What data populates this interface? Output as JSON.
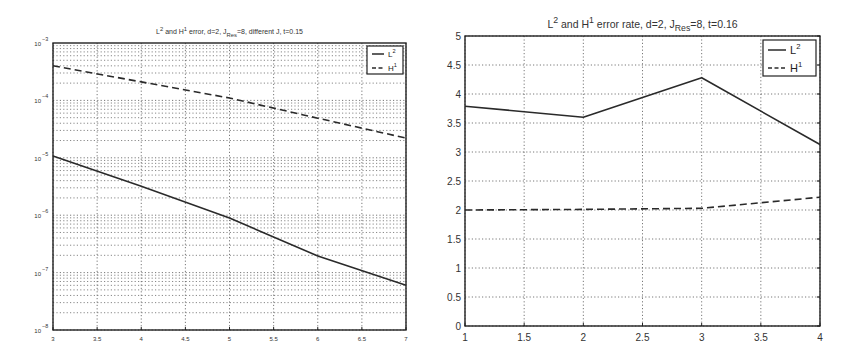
{
  "chart_data": [
    {
      "type": "line",
      "title": "L2 and H1 error, d=2, J_Res=8, different J, t=0.15",
      "title_parts": {
        "pre": "L",
        "sup1": "2",
        "mid": " and H",
        "sup2": "1",
        "post1": " error, d=2, J",
        "sub": "Res",
        "post2": "=8, different J, t=0.15"
      },
      "xlabel": "",
      "ylabel": "",
      "y_scale": "log",
      "xlim": [
        3,
        7
      ],
      "ylim": [
        1e-08,
        0.001
      ],
      "x_ticks": [
        3,
        3.5,
        4,
        4.5,
        5,
        5.5,
        6,
        6.5,
        7
      ],
      "x_tick_labels": [
        "3",
        "3.5",
        "4",
        "4.5",
        "5",
        "5.5",
        "6",
        "6.5",
        "7"
      ],
      "y_ticks_exponents": [
        -3,
        -4,
        -5,
        -6,
        -7,
        -8
      ],
      "grid": true,
      "minor_grid": true,
      "legend_position": "upper right",
      "x": [
        3,
        4,
        5,
        6,
        7
      ],
      "series": [
        {
          "name": "L2",
          "label_base": "L",
          "label_sup": "2",
          "style": "solid",
          "values": [
            1.07e-05,
            3.2e-06,
            8.9e-07,
            1.95e-07,
            6e-08
          ]
        },
        {
          "name": "H1",
          "label_base": "H",
          "label_sup": "1",
          "style": "dashed",
          "values": [
            0.0004,
            0.00021,
            0.00011,
            4.9e-05,
            2.2e-05
          ]
        }
      ]
    },
    {
      "type": "line",
      "title": "L2 and H1 error rate, d=2, J_Res=8, t=0.16",
      "title_parts": {
        "pre": "L",
        "sup1": "2",
        "mid": " and H",
        "sup2": "1",
        "post1": " error rate, d=2, J",
        "sub": "Res",
        "post2": "=8, t=0.16"
      },
      "xlabel": "",
      "ylabel": "",
      "y_scale": "linear",
      "xlim": [
        1,
        4
      ],
      "ylim": [
        0,
        5
      ],
      "x_ticks": [
        1,
        1.5,
        2,
        2.5,
        3,
        3.5,
        4
      ],
      "x_tick_labels": [
        "1",
        "1.5",
        "2",
        "2.5",
        "3",
        "3.5",
        "4"
      ],
      "y_ticks": [
        0,
        0.5,
        1,
        1.5,
        2,
        2.5,
        3,
        3.5,
        4,
        4.5,
        5
      ],
      "y_tick_labels": [
        "0",
        "0.5",
        "1",
        "1.5",
        "2",
        "2.5",
        "3",
        "3.5",
        "4",
        "4.5",
        "5"
      ],
      "grid": true,
      "legend_position": "upper right",
      "x": [
        1,
        2,
        3,
        4
      ],
      "series": [
        {
          "name": "L2",
          "label_base": "L",
          "label_sup": "2",
          "style": "solid",
          "values": [
            3.79,
            3.6,
            4.28,
            3.13
          ]
        },
        {
          "name": "H1",
          "label_base": "H",
          "label_sup": "1",
          "style": "dashed",
          "values": [
            2.0,
            2.01,
            2.03,
            2.22
          ]
        }
      ]
    }
  ],
  "colors": {
    "line": "#2a2a2a",
    "grid": "#555555",
    "frame": "#222222",
    "background": "#ffffff"
  }
}
